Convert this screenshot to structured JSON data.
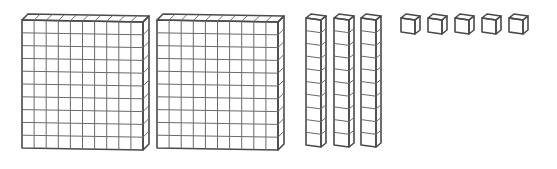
{
  "figure": {
    "colors": {
      "face": "#ebebeb",
      "top": "#d9d9d9",
      "side": "#c8c8c8",
      "edge": "#4a4a4a",
      "grid": "#6a6a6a",
      "background": "#ffffff"
    },
    "groups": [
      {
        "name": "hundreds-flats",
        "count": 2,
        "block_value": 100
      },
      {
        "name": "tens-rods",
        "count": 3,
        "block_value": 10
      },
      {
        "name": "ones-units",
        "count": 5,
        "block_value": 1
      }
    ],
    "flats": [
      {
        "x": 22,
        "y": 20,
        "w": 121,
        "h": 128
      },
      {
        "x": 157,
        "y": 20,
        "w": 121,
        "h": 128
      }
    ],
    "rods": [
      {
        "x": 306,
        "y": 18,
        "w": 15,
        "h": 127
      },
      {
        "x": 334,
        "y": 18,
        "w": 15,
        "h": 127
      },
      {
        "x": 361,
        "y": 18,
        "w": 15,
        "h": 127
      }
    ],
    "units": [
      {
        "x": 401,
        "y": 18
      },
      {
        "x": 428,
        "y": 18
      },
      {
        "x": 455,
        "y": 18
      },
      {
        "x": 482,
        "y": 18
      },
      {
        "x": 509,
        "y": 18
      }
    ]
  }
}
